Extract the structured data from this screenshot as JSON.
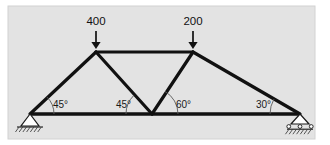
{
  "figure": {
    "type": "truss-free-body-diagram",
    "panel": {
      "background_color": "#e3e3e3",
      "border_color": "#d2d2d2",
      "x": 8,
      "y": 6,
      "width": 307,
      "height": 133
    },
    "member_color": "#111111",
    "annotation_color": "#5a5a5a"
  },
  "chart_data": {
    "type": "diagram",
    "title": "",
    "xlabel": "",
    "ylabel": "",
    "joints": [
      {
        "id": "A",
        "name": "left-support-joint",
        "x": 30,
        "y": 114
      },
      {
        "id": "B",
        "name": "left-top-joint",
        "x": 96,
        "y": 52
      },
      {
        "id": "C",
        "name": "right-top-joint",
        "x": 193,
        "y": 52
      },
      {
        "id": "D",
        "name": "bottom-middle-joint",
        "x": 152,
        "y": 114
      },
      {
        "id": "E",
        "name": "right-support-joint",
        "x": 300,
        "y": 114
      }
    ],
    "members": [
      {
        "name": "bottom-chord",
        "from": "A",
        "to": "E"
      },
      {
        "name": "left-inclined-chord",
        "from": "A",
        "to": "B"
      },
      {
        "name": "top-chord",
        "from": "B",
        "to": "C"
      },
      {
        "name": "left-diagonal",
        "from": "B",
        "to": "D"
      },
      {
        "name": "right-diagonal",
        "from": "D",
        "to": "C"
      },
      {
        "name": "right-inclined-chord",
        "from": "C",
        "to": "E"
      }
    ],
    "loads": [
      {
        "name": "load-400",
        "label": "400",
        "value": 400,
        "direction": "down",
        "at_joint": "B",
        "label_x": 96,
        "label_y": 25,
        "arrow_x": 96,
        "arrow_top_y": 31,
        "arrow_bottom_y": 49
      },
      {
        "name": "load-200",
        "label": "200",
        "value": 200,
        "direction": "down",
        "at_joint": "C",
        "label_x": 193,
        "label_y": 25,
        "arrow_x": 193,
        "arrow_top_y": 31,
        "arrow_bottom_y": 49
      }
    ],
    "angles": [
      {
        "name": "angle-left-support",
        "label": "45°",
        "value": 45,
        "vertex": "A",
        "label_x": 53,
        "label_y": 108,
        "arc_radius": 24,
        "arc_start_deg": 0,
        "arc_end_deg": 45,
        "opens": "ccw-from-bottom-chord"
      },
      {
        "name": "angle-bottom-middle-left",
        "label": "45°",
        "value": 45,
        "vertex": "D",
        "label_x": 116,
        "label_y": 108,
        "arc_radius": 26,
        "arc_start_deg": 135,
        "arc_end_deg": 180,
        "opens": "cw-toward-left-diagonal"
      },
      {
        "name": "angle-bottom-middle-right",
        "label": "60°",
        "value": 60,
        "vertex": "D",
        "label_x": 176,
        "label_y": 108,
        "arc_radius": 26,
        "arc_start_deg": 0,
        "arc_end_deg": 60,
        "opens": "ccw-toward-right-diagonal"
      },
      {
        "name": "angle-right-support",
        "label": "30°",
        "value": 30,
        "vertex": "E",
        "label_x": 256,
        "label_y": 108,
        "arc_radius": 30,
        "arc_start_deg": 150,
        "arc_end_deg": 180,
        "opens": "cw-from-bottom-chord"
      }
    ],
    "supports": [
      {
        "name": "pin-support",
        "kind": "pin",
        "at_joint": "A",
        "x": 30,
        "y": 114,
        "triangle_half_width": 9,
        "triangle_height": 12,
        "ground_width": 26,
        "hatch_count": 7
      },
      {
        "name": "roller-support",
        "kind": "roller",
        "at_joint": "E",
        "x": 300,
        "y": 114,
        "triangle_half_width": 9,
        "triangle_height": 10,
        "roller_count": 3,
        "ground_width": 26,
        "hatch_count": 7
      }
    ],
    "legend": [],
    "grid": false
  }
}
